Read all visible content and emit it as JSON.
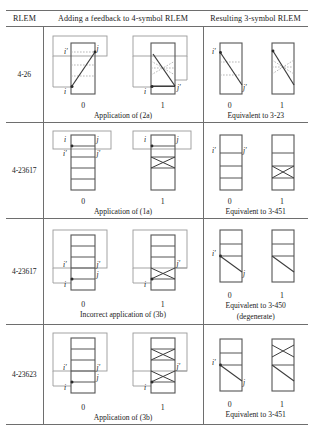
{
  "figure": {
    "type": "table",
    "columns": [
      "RLEM",
      "Adding a feedback to 4-symbol RLEM",
      "Resulting 3-symbol RLEM"
    ],
    "state_labels": [
      "0",
      "1"
    ],
    "port_labels": {
      "i": "i",
      "i_prime": "i′",
      "j": "j",
      "j_prime": "j′"
    },
    "rows": [
      {
        "rlem": "4-26",
        "middle_caption": "Application of (2a)",
        "right_caption": "Equivalent to 3-23",
        "right_subcaption": "",
        "middle_panels": [
          {
            "state": "0",
            "labels": [
              "i′",
              "j",
              "i"
            ]
          },
          {
            "state": "1",
            "labels": [
              "i",
              "j′"
            ]
          }
        ],
        "right_panels": [
          {
            "state": "0",
            "labels": [
              "i′",
              "j′"
            ]
          },
          {
            "state": "1",
            "labels": []
          }
        ]
      },
      {
        "rlem": "4-23617",
        "middle_caption": "Application of (1a)",
        "right_caption": "Equivalent to 3-451",
        "right_subcaption": "",
        "middle_panels": [
          {
            "state": "0",
            "labels": [
              "i",
              "j",
              "i′",
              "j′"
            ]
          },
          {
            "state": "1",
            "labels": [
              "i",
              "j"
            ]
          }
        ],
        "right_panels": [
          {
            "state": "0",
            "labels": [
              "i′",
              "j′"
            ]
          },
          {
            "state": "1",
            "labels": []
          }
        ]
      },
      {
        "rlem": "4-23617",
        "middle_caption": "Incorrect application of (3b)",
        "right_caption": "Equivalent to 3-450",
        "right_subcaption": "(degenerate)",
        "middle_panels": [
          {
            "state": "0",
            "labels": [
              "i′",
              "j′",
              "i",
              "j"
            ]
          },
          {
            "state": "1",
            "labels": [
              "i",
              "j′"
            ]
          }
        ],
        "right_panels": [
          {
            "state": "0",
            "labels": [
              "i′",
              "j"
            ]
          },
          {
            "state": "1",
            "labels": []
          }
        ]
      },
      {
        "rlem": "4-23623",
        "middle_caption": "Application of (3b)",
        "right_caption": "Equivalent to 3-451",
        "right_subcaption": "",
        "middle_panels": [
          {
            "state": "0",
            "labels": [
              "i′",
              "j′",
              "i",
              "j"
            ]
          },
          {
            "state": "1",
            "labels": [
              "i",
              "j′"
            ]
          }
        ],
        "right_panels": [
          {
            "state": "0",
            "labels": [
              "i′",
              "j"
            ]
          },
          {
            "state": "1",
            "labels": []
          }
        ]
      }
    ],
    "colors": {
      "rule_line": "#6e6e6e",
      "box_stroke": "#555555",
      "feedback_stroke": "#9a9a9a",
      "path_stroke": "#3c3c3c",
      "dashed_stroke": "#a5a5a5"
    }
  }
}
